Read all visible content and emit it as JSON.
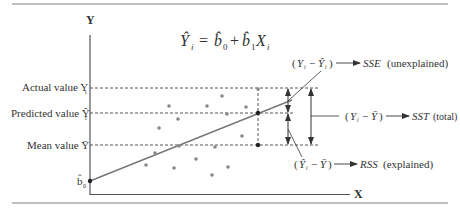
{
  "diagram": {
    "equation": {
      "lhs": "Ŷ",
      "lhs_sub": "i",
      "eq": "=",
      "b0": "b̂",
      "b0_sub": "0",
      "plus": "+",
      "b1": "b̂",
      "b1_sub": "1",
      "x": "X",
      "x_sub": "i"
    },
    "axes": {
      "y_label": "Y",
      "x_label": "X"
    },
    "y_labels": {
      "actual": {
        "text": "Actual value Y",
        "sub": "i"
      },
      "predicted": {
        "text": "Predicted value Ŷ",
        "sub": "i"
      },
      "mean": {
        "text": "Mean value Ȳ"
      },
      "intercept": {
        "text": "b̂",
        "sub": "0"
      }
    },
    "annotations": {
      "sse": {
        "term": "(Y  − Ŷ )",
        "target": "SSE",
        "desc": "(unexplained)"
      },
      "sst": {
        "term": "(Y  − Ȳ)",
        "target": "SST",
        "desc": "(total)"
      },
      "rss": {
        "term": "(Ŷ  − Ȳ)",
        "target": "RSS",
        "desc": "(explained)"
      }
    },
    "colors": {
      "line": "#777777",
      "point": "#888888",
      "text": "#333333",
      "rule": "#999999"
    },
    "points": [
      [
        169,
        106
      ],
      [
        207,
        106
      ],
      [
        222,
        96
      ],
      [
        246,
        107
      ],
      [
        227,
        114
      ],
      [
        178,
        119
      ],
      [
        159,
        128
      ],
      [
        242,
        136
      ],
      [
        215,
        147
      ],
      [
        179,
        146
      ],
      [
        155,
        153
      ],
      [
        196,
        159
      ],
      [
        146,
        165
      ],
      [
        174,
        168
      ],
      [
        228,
        167
      ],
      [
        212,
        175
      ],
      [
        258,
        89
      ]
    ]
  }
}
